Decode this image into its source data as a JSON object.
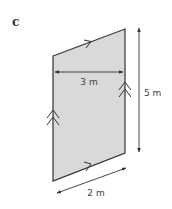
{
  "part_label": "c",
  "shape": {
    "type": "parallelogram",
    "fill": "#d9d9d9",
    "stroke": "#333333",
    "vertices": {
      "top_left": [
        53,
        56
      ],
      "top_right": [
        125,
        29
      ],
      "bottom_right": [
        125,
        153
      ],
      "bottom_left": [
        53,
        181
      ]
    }
  },
  "dimensions": {
    "width": "3 m",
    "height": "5 m",
    "slant": "2 m"
  },
  "markers": {
    "single_arrow_sides": [
      "top",
      "bottom"
    ],
    "double_arrow_sides": [
      "left",
      "right"
    ]
  }
}
